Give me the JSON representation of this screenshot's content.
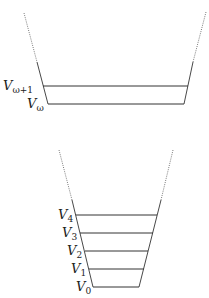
{
  "diagram": {
    "line_color": "#333333",
    "top_funnel": {
      "levels": [
        {
          "base": "V",
          "sub": "ω+1",
          "y": 86
        },
        {
          "base": "V",
          "sub": "ω",
          "y": 104
        }
      ]
    },
    "bottom_funnel": {
      "levels": [
        {
          "base": "V",
          "sub": "4",
          "y": 215
        },
        {
          "base": "V",
          "sub": "3",
          "y": 233
        },
        {
          "base": "V",
          "sub": "2",
          "y": 251
        },
        {
          "base": "V",
          "sub": "1",
          "y": 269
        },
        {
          "base": "V",
          "sub": "0",
          "y": 287
        }
      ]
    }
  }
}
